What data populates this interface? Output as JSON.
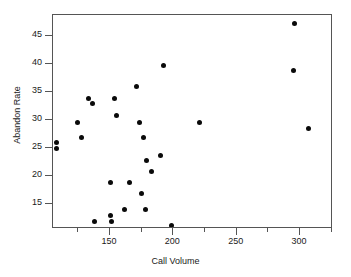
{
  "chart_data": {
    "type": "scatter",
    "title": "",
    "xlabel": "Call Volume",
    "ylabel": "Abandon Rate",
    "xlim": [
      105,
      326
    ],
    "ylim": [
      10.5,
      48.8
    ],
    "xticks": [
      150,
      200,
      250,
      300
    ],
    "xticklabels": [
      "150",
      "200",
      "250",
      "300"
    ],
    "yticks": [
      15,
      20,
      25,
      30,
      35,
      40,
      45
    ],
    "yticklabels": [
      "15",
      "20",
      "25",
      "30",
      "35",
      "40",
      "45"
    ],
    "grid": false,
    "legend": null,
    "marker": "filled-circle",
    "marker_color": "#0a0a0a",
    "series": [
      {
        "name": "calls",
        "points": [
          [
            107.5,
            25.9
          ],
          [
            107.5,
            24.9
          ],
          [
            124.3,
            29.6
          ],
          [
            127.6,
            26.8
          ],
          [
            132.8,
            33.9
          ],
          [
            136.1,
            32.9
          ],
          [
            138.0,
            11.9
          ],
          [
            150.0,
            18.9
          ],
          [
            150.4,
            13.0
          ],
          [
            151.0,
            11.9
          ],
          [
            153.5,
            33.9
          ],
          [
            155.4,
            30.8
          ],
          [
            161.5,
            14.0
          ],
          [
            165.0,
            18.9
          ],
          [
            170.9,
            36.0
          ],
          [
            173.0,
            29.6
          ],
          [
            175.2,
            16.8
          ],
          [
            176.5,
            26.8
          ],
          [
            178.0,
            14.0
          ],
          [
            179.0,
            22.7
          ],
          [
            183.0,
            20.8
          ],
          [
            190.0,
            23.6
          ],
          [
            192.0,
            39.8
          ],
          [
            198.8,
            11.2
          ],
          [
            220.9,
            29.6
          ],
          [
            295.9,
            47.2
          ],
          [
            295.1,
            38.8
          ],
          [
            306.7,
            28.5
          ]
        ]
      }
    ]
  }
}
